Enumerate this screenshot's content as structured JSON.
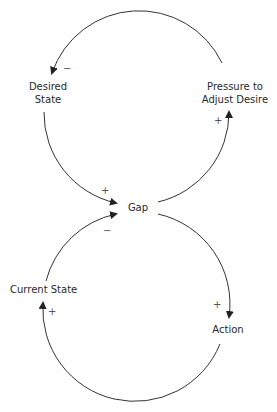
{
  "diagram": {
    "type": "causal-loop",
    "nodes": {
      "desired_state": {
        "line1": "Desired",
        "line2": "State"
      },
      "pressure": {
        "line1": "Pressure to",
        "line2": "Adjust Desire"
      },
      "gap": {
        "label": "Gap"
      },
      "current_state": {
        "label": "Current State"
      },
      "action": {
        "label": "Action"
      }
    },
    "polarities": {
      "pressure_to_desired": "−",
      "desired_to_gap": "+",
      "gap_to_pressure": "+",
      "current_to_gap": "−",
      "gap_to_action": "+",
      "action_to_current": "+"
    },
    "edges": [
      {
        "from": "Pressure to Adjust Desire",
        "to": "Desired State",
        "polarity": "-"
      },
      {
        "from": "Desired State",
        "to": "Gap",
        "polarity": "+"
      },
      {
        "from": "Gap",
        "to": "Pressure to Adjust Desire",
        "polarity": "+"
      },
      {
        "from": "Current State",
        "to": "Gap",
        "polarity": "-"
      },
      {
        "from": "Gap",
        "to": "Action",
        "polarity": "+"
      },
      {
        "from": "Action",
        "to": "Current State",
        "polarity": "+"
      }
    ],
    "colors": {
      "line": "#333333",
      "text": "#2a2a2a"
    }
  }
}
